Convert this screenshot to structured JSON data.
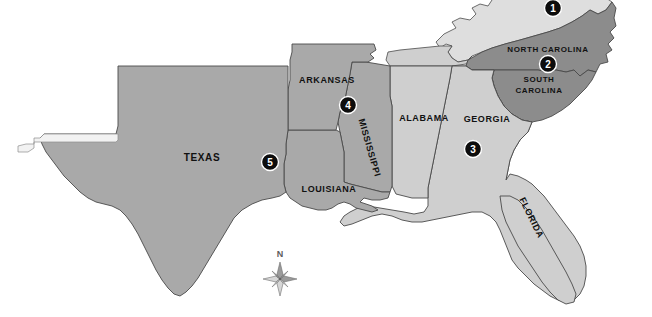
{
  "map": {
    "title": "Southeastern United States reference map",
    "background_color": "#ffffff",
    "border_color": "#4a4a4a",
    "label_color": "#111111",
    "states": [
      {
        "id": "texas",
        "label": "TEXAS",
        "fill": "#a9a9a9",
        "label_x": 202,
        "label_y": 158,
        "font_size": 10,
        "rotation": 0
      },
      {
        "id": "louisiana",
        "label": "LOUISIANA",
        "fill": "#a9a9a9",
        "label_x": 329,
        "label_y": 190,
        "font_size": 9,
        "rotation": 0
      },
      {
        "id": "arkansas",
        "label": "ARKANSAS",
        "fill": "#a9a9a9",
        "label_x": 327,
        "label_y": 81,
        "font_size": 9,
        "rotation": 0
      },
      {
        "id": "mississippi",
        "label": "MISSISSIPPI",
        "fill": "#a9a9a9",
        "label_x": 369,
        "label_y": 148,
        "font_size": 9,
        "rotation": 74
      },
      {
        "id": "alabama",
        "label": "ALABAMA",
        "fill": "#cfcfcf",
        "label_x": 424,
        "label_y": 119,
        "font_size": 9,
        "rotation": 0
      },
      {
        "id": "georgia",
        "label": "GEORGIA",
        "fill": "#cfcfcf",
        "label_x": 487,
        "label_y": 120,
        "font_size": 9,
        "rotation": 0
      },
      {
        "id": "florida",
        "label": "FLORIDA",
        "fill": "#cfcfcf",
        "label_x": 531,
        "label_y": 218,
        "font_size": 9,
        "rotation": 64
      },
      {
        "id": "north-carolina",
        "label": "NORTH CAROLINA",
        "fill": "#8c8c8c",
        "label_x": 548,
        "label_y": 50,
        "font_size": 8,
        "rotation": 0
      },
      {
        "id": "south-carolina-line1",
        "label": "SOUTH",
        "fill": "#8c8c8c",
        "label_x": 539,
        "label_y": 80,
        "font_size": 8,
        "rotation": 0
      },
      {
        "id": "south-carolina-line2",
        "label": "CAROLINA",
        "fill": "#8c8c8c",
        "label_x": 539,
        "label_y": 91,
        "font_size": 8,
        "rotation": 0
      },
      {
        "id": "virginia",
        "label": "",
        "fill": "#dedede",
        "label_x": 0,
        "label_y": 0,
        "font_size": 8,
        "rotation": 0
      },
      {
        "id": "tennessee",
        "label": "",
        "fill": "#cfcfcf",
        "label_x": 0,
        "label_y": 0,
        "font_size": 8,
        "rotation": 0
      }
    ],
    "markers": [
      {
        "id": "marker-1",
        "number": "1",
        "x": 553,
        "y": 8,
        "radius": 8.5
      },
      {
        "id": "marker-2",
        "number": "2",
        "x": 548,
        "y": 64,
        "radius": 8.5
      },
      {
        "id": "marker-3",
        "number": "3",
        "x": 473,
        "y": 149,
        "radius": 8.5
      },
      {
        "id": "marker-4",
        "number": "4",
        "x": 348,
        "y": 105,
        "radius": 8.5
      },
      {
        "id": "marker-5",
        "number": "5",
        "x": 270,
        "y": 162,
        "radius": 8.5
      }
    ],
    "compass": {
      "label": "N",
      "x": 280,
      "y": 275,
      "label_x": 280,
      "label_y": 254,
      "color": "#6e6e6e"
    }
  }
}
